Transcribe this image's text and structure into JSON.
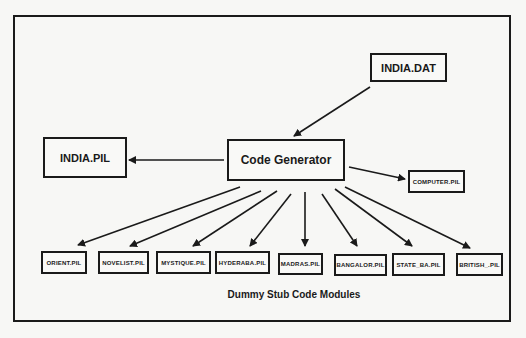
{
  "diagram": {
    "type": "flow",
    "nodes": {
      "input_file": "INDIA.DAT",
      "generator": "Code Generator",
      "main_output": "INDIA.PIL",
      "side_output": "COMPUTER.PIL"
    },
    "stub_modules": [
      "ORIENT.PIL",
      "NOVELIST.PIL",
      "MYSTIQUE.PIL",
      "HYDERABA.PIL",
      "MADRAS.PIL",
      "BANGALOR.PIL",
      "STATE_BA.PIL",
      "BRITISH_.PIL"
    ],
    "caption": "Dummy Stub Code Modules",
    "edges": [
      {
        "from": "INDIA.DAT",
        "to": "Code Generator"
      },
      {
        "from": "Code Generator",
        "to": "INDIA.PIL"
      },
      {
        "from": "Code Generator",
        "to": "COMPUTER.PIL"
      },
      {
        "from": "Code Generator",
        "to": "ORIENT.PIL"
      },
      {
        "from": "Code Generator",
        "to": "NOVELIST.PIL"
      },
      {
        "from": "Code Generator",
        "to": "MYSTIQUE.PIL"
      },
      {
        "from": "Code Generator",
        "to": "HYDERABA.PIL"
      },
      {
        "from": "Code Generator",
        "to": "MADRAS.PIL"
      },
      {
        "from": "Code Generator",
        "to": "BANGALOR.PIL"
      },
      {
        "from": "Code Generator",
        "to": "STATE_BA.PIL"
      },
      {
        "from": "Code Generator",
        "to": "BRITISH_.PIL"
      }
    ]
  }
}
